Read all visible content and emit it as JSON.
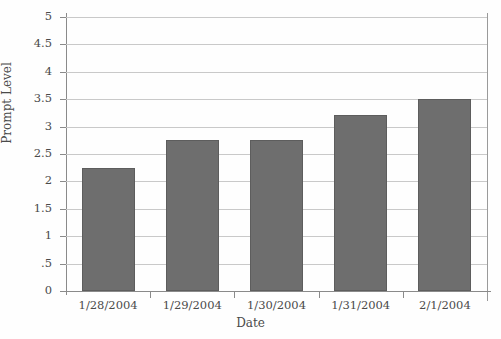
{
  "chart_data": {
    "type": "bar",
    "title": "",
    "xlabel": "Date",
    "ylabel": "Prompt Level",
    "categories": [
      "1/28/2004",
      "1/29/2004",
      "1/30/2004",
      "1/31/2004",
      "2/1/2004"
    ],
    "values": [
      2.25,
      2.75,
      2.75,
      3.22,
      3.5
    ],
    "ylim": [
      0,
      5
    ],
    "ytick_labels": [
      "5",
      "4.5",
      "4",
      "3.5",
      "3",
      "2.5",
      "2",
      "1.5",
      "1",
      ".5",
      "0"
    ],
    "ytick_values": [
      5,
      4.5,
      4,
      3.5,
      3,
      2.5,
      2,
      1.5,
      1,
      0.5,
      0
    ],
    "grid": true,
    "legend": "none",
    "bar_color": "#6e6e6e",
    "grid_color": "#c9c9c9",
    "axis_color": "#8a8a8a",
    "text_color": "#4a4a4a",
    "background_color": "#fefefe"
  }
}
